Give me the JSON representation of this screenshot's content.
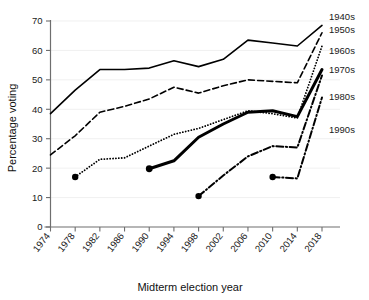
{
  "chart_data": {
    "type": "line",
    "title": "",
    "xlabel": "Midterm election year",
    "ylabel": "Percentage voting",
    "xlim": [
      1974,
      2018
    ],
    "ylim": [
      0,
      70
    ],
    "grid": true,
    "legend_position": "right",
    "x": [
      1974,
      1978,
      1982,
      1986,
      1990,
      1994,
      1998,
      2002,
      2006,
      2010,
      2014,
      2018
    ],
    "xtick_labels": [
      "1974",
      "1978",
      "1982",
      "1986",
      "1990",
      "1994",
      "1998",
      "2002",
      "2006",
      "2010",
      "2014",
      "2018"
    ],
    "ytick_labels": [
      "0",
      "10",
      "20",
      "30",
      "40",
      "50",
      "60",
      "70"
    ],
    "ytick_values": [
      0,
      10,
      20,
      30,
      40,
      50,
      60,
      70
    ],
    "series": [
      {
        "name": "1940s",
        "style": "solid",
        "width": 1.6,
        "marker_start": false,
        "x": [
          1974,
          1978,
          1982,
          1986,
          1990,
          1994,
          1998,
          2002,
          2006,
          2010,
          2014,
          2018
        ],
        "values": [
          38.5,
          46.5,
          53.5,
          53.5,
          54.0,
          56.5,
          54.5,
          57.0,
          63.5,
          62.5,
          61.5,
          68.5
        ]
      },
      {
        "name": "1950s",
        "style": "dashed",
        "width": 1.6,
        "marker_start": false,
        "x": [
          1974,
          1978,
          1982,
          1986,
          1990,
          1994,
          1998,
          2002,
          2006,
          2010,
          2014,
          2018
        ],
        "values": [
          24.5,
          31.0,
          39.0,
          41.0,
          43.5,
          47.5,
          45.5,
          48.0,
          50.0,
          49.5,
          49.0,
          66.0
        ]
      },
      {
        "name": "1960s",
        "style": "dotted",
        "width": 1.8,
        "marker_start": true,
        "x": [
          1978,
          1982,
          1986,
          1990,
          1994,
          1998,
          2002,
          2006,
          2010,
          2014,
          2018
        ],
        "values": [
          17.0,
          23.0,
          23.5,
          27.5,
          31.5,
          33.5,
          36.5,
          39.5,
          38.5,
          37.0,
          61.5
        ]
      },
      {
        "name": "1970s",
        "style": "thick-solid",
        "width": 3.0,
        "marker_start": true,
        "x": [
          1990,
          1994,
          1998,
          2002,
          2006,
          2010,
          2014,
          2018
        ],
        "values": [
          19.8,
          22.5,
          30.5,
          35.0,
          39.0,
          39.5,
          37.5,
          53.5
        ]
      },
      {
        "name": "1980s",
        "style": "dash-dot",
        "width": 2.0,
        "marker_start": true,
        "x": [
          1998,
          2002,
          2006,
          2010,
          2014,
          2018
        ],
        "values": [
          10.5,
          17.5,
          24.0,
          27.5,
          27.0,
          51.5
        ]
      },
      {
        "name": "1990s",
        "style": "dash-dot",
        "width": 2.0,
        "marker_start": true,
        "x": [
          2010,
          2014,
          2018
        ],
        "values": [
          17.0,
          16.5,
          44.0
        ]
      }
    ],
    "legend": [
      {
        "label": "1940s",
        "y": 20
      },
      {
        "label": "1950s",
        "y": 33
      },
      {
        "label": "1960s",
        "y": 54
      },
      {
        "label": "1970s",
        "y": 73
      },
      {
        "label": "1980s",
        "y": 100
      },
      {
        "label": "1990s",
        "y": 133
      }
    ],
    "colors": {
      "line": "#000000",
      "axis": "#6e6e6e",
      "grid": "#e9e9e9",
      "text": "#1a1a1a",
      "background": "#ffffff"
    }
  }
}
